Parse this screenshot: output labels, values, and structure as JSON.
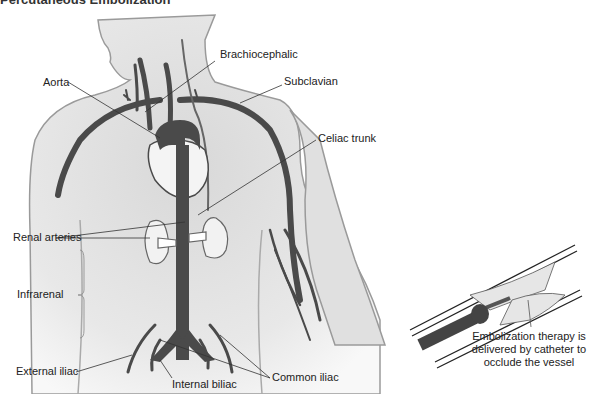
{
  "heading": "Percutaneous Embolization",
  "labels": {
    "brachiocephalic": "Brachiocephalic",
    "aorta": "Aorta",
    "subclavian": "Subclavian",
    "celiac_trunk": "Celiac trunk",
    "renal_arteries": "Renal arteries",
    "infrarenal": "Infrarenal",
    "external_iliac": "External iliac",
    "internal_iliac": "Internal biliac",
    "common_iliac": "Common iliac"
  },
  "inset": {
    "caption_lines": [
      "Embolization therapy is",
      "delivered by catheter to",
      "occlude the vessel"
    ]
  },
  "colors": {
    "vessel": "#4a4a4a",
    "body_fill": "#e6e6e6",
    "body_outline": "#9a9a9a",
    "organ_fill": "#f4f4f4"
  }
}
